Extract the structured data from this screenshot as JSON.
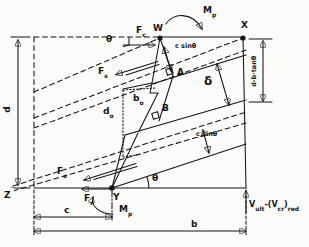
{
  "colors": {
    "ink": "#141414",
    "background": "#fbfbf9"
  },
  "points": {
    "w": "W",
    "x": "X",
    "y": "Y",
    "z": "Z"
  },
  "crack_points": {
    "a": "A",
    "b": "B"
  },
  "angles": {
    "theta_top": "θ",
    "theta_bottom": "θ"
  },
  "forces": {
    "fc": {
      "main": "F",
      "sub": "c"
    },
    "fs_upper": {
      "main": "F",
      "sub": "s"
    },
    "fs_lower": {
      "main": "F",
      "sub": "s"
    },
    "fr": {
      "main": "F",
      "sub": "r"
    },
    "mp_top": {
      "main": "M",
      "sub": "p"
    },
    "mp_bottom": {
      "main": "M",
      "sub": "p"
    },
    "v_reaction": {
      "p1": "V",
      "s1": "ult",
      "p2": "-(V",
      "s2": "cr",
      "p3": ")",
      "s3": "red"
    }
  },
  "dimensions": {
    "d": "d",
    "b": "b",
    "c": "c",
    "d_minus_b_tan_theta": "d-b·tanθ",
    "c_sin_theta_upper": "c sinθ",
    "c_sin_theta_lower": "c sinθ",
    "delta": "δ",
    "b_o": {
      "main": "b",
      "sub": "o"
    },
    "d_o": {
      "main": "d",
      "sub": "o"
    }
  }
}
